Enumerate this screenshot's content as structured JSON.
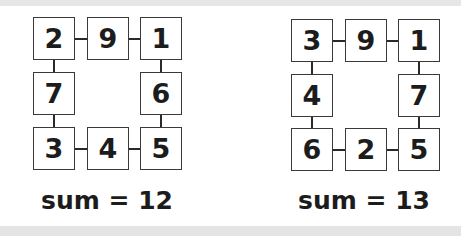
{
  "puzzles": [
    {
      "cells": {
        "top_left": "2",
        "top_mid": "9",
        "top_right": "1",
        "mid_left": "7",
        "mid_right": "6",
        "bot_left": "3",
        "bot_mid": "4",
        "bot_right": "5"
      },
      "sum_label": "sum = 12"
    },
    {
      "cells": {
        "top_left": "3",
        "top_mid": "9",
        "top_right": "1",
        "mid_left": "4",
        "mid_right": "7",
        "bot_left": "6",
        "bot_mid": "2",
        "bot_right": "5"
      },
      "sum_label": "sum = 13"
    }
  ]
}
